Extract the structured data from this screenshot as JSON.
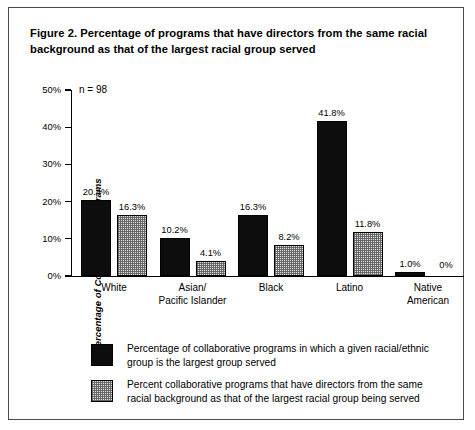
{
  "figure": {
    "title": "Figure 2. Percentage of programs that have directors from the same racial background as that of the largest racial group served",
    "sample_size_note": "n = 98"
  },
  "chart_data": {
    "type": "bar",
    "title": "Figure 2. Percentage of programs that have directors from the same racial background as that of the largest racial group served",
    "xlabel": "",
    "ylabel": "Percentage of Collaborative Programs",
    "ylim": [
      0,
      50
    ],
    "ytick_labels": [
      "0%",
      "10%",
      "20%",
      "30%",
      "40%",
      "50%"
    ],
    "ytick_values": [
      0,
      10,
      20,
      30,
      40,
      50
    ],
    "grid": false,
    "legend_position": "below",
    "annotation": "n = 98",
    "categories": [
      "White",
      "Asian/\nPacific Islander",
      "Black",
      "Latino",
      "Native\nAmerican"
    ],
    "category_lines": [
      [
        "White"
      ],
      [
        "Asian/",
        "Pacific Islander"
      ],
      [
        "Black"
      ],
      [
        "Latino"
      ],
      [
        "Native",
        "American"
      ]
    ],
    "series": [
      {
        "name": "Percentage of collaborative programs in which a given racial/ethnic group is the largest group served",
        "fill": "solid-black",
        "color": "#0d0d0d",
        "values": [
          20.4,
          10.2,
          16.3,
          41.8,
          1.0
        ],
        "labels": [
          "20.4%",
          "10.2%",
          "16.3%",
          "41.8%",
          "1.0%"
        ]
      },
      {
        "name": "Percent collaborative programs that have directors from the same racial background as that of the largest racial group being served",
        "fill": "stippled-gray",
        "color": "#e2e2e2",
        "values": [
          16.3,
          4.1,
          8.2,
          11.8,
          0
        ],
        "labels": [
          "16.3%",
          "4.1%",
          "8.2%",
          "11.8%",
          "0%"
        ]
      }
    ]
  },
  "legend": {
    "items": [
      {
        "swatch": "solid-black",
        "line1": "Percentage of collaborative programs in which a given racial/ethnic",
        "line2": "group is the largest group served"
      },
      {
        "swatch": "stippled-gray",
        "line1": "Percent collaborative programs that have directors from the same",
        "line2": "racial background as that of the largest racial group being served"
      }
    ]
  }
}
